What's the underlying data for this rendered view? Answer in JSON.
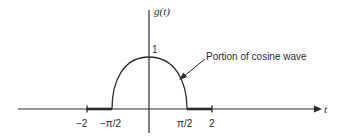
{
  "diagram": {
    "title": "",
    "y_axis_label": "g(t)",
    "x_axis_label": "t",
    "peak_label": "1",
    "annotation": "Portion of cosine wave",
    "tick_labels": {
      "neg_two": "−2",
      "neg_pi_half": "−π/2",
      "pi_half": "π/2",
      "two": "2"
    },
    "colors": {
      "ink": "#2a2a2a",
      "background": "#ffffff"
    }
  }
}
